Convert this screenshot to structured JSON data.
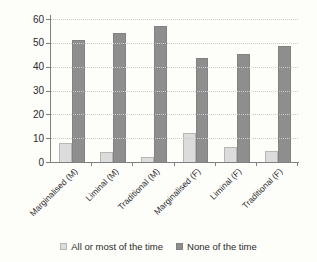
{
  "chart_data": {
    "type": "bar",
    "categories": [
      "Marginalised (M)",
      "Liminal (M)",
      "Traditional (M)",
      "Marginalised (F)",
      "Liminal (F)",
      "Traditional (F)"
    ],
    "series": [
      {
        "name": "All or most of the time",
        "color": "#dcdcdc",
        "border_color": "#b6b6b6",
        "values": [
          8,
          4,
          2,
          12,
          6.5,
          4.5
        ]
      },
      {
        "name": "None of the time",
        "color": "#8e8e8e",
        "border_color": "#828282",
        "values": [
          51,
          54,
          57,
          43.5,
          45.5,
          48.5
        ]
      }
    ],
    "xlabel": "",
    "ylabel": "",
    "ylim": [
      0,
      60
    ],
    "yticks": [
      0,
      10,
      20,
      30,
      40,
      50,
      60
    ],
    "grid": "horizontal dotted",
    "legend_position": "bottom center",
    "axis_color": "#808080",
    "grid_color": "#cccccc",
    "text_color": "#2b2b2b",
    "background": "#fdfdfa"
  }
}
